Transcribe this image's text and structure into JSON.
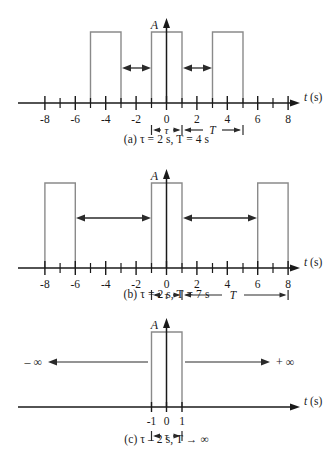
{
  "figure": {
    "axis_color": "#1a1a1a",
    "pulse_color": "#8a8a8a",
    "arrow_color": "#2a2a2a",
    "amplitude_label": "A",
    "time_axis_label": "t (s)",
    "tau_symbol": "τ",
    "period_symbol": "T"
  },
  "panels": [
    {
      "id": "a",
      "caption": "(a) τ = 2 s,  T = 4 s",
      "tau": 2,
      "period": 4,
      "amplitude_label": "A",
      "axis_label": "t (s)",
      "tau_label": "τ",
      "period_label": "T",
      "xmin": -9,
      "xmax": 9,
      "major_ticks": [
        -8,
        -6,
        -4,
        -2,
        0,
        2,
        4,
        6,
        8
      ],
      "tick_labels": [
        "-8",
        "-6",
        "-4",
        "-2",
        "0",
        "2",
        "4",
        "6",
        "8"
      ],
      "minor_ticks": [
        -7,
        -5,
        -3,
        -1,
        1,
        3,
        5,
        7
      ],
      "pulses": [
        {
          "start": -5,
          "end": -3
        },
        {
          "start": -1,
          "end": 1
        },
        {
          "start": 3,
          "end": 5
        }
      ],
      "gap_arrows": [
        {
          "from": -3,
          "to": -1
        },
        {
          "from": 1,
          "to": 3
        }
      ],
      "tau_span": {
        "from": -1,
        "to": 1
      },
      "period_span": {
        "from": 1,
        "to": 5
      }
    },
    {
      "id": "b",
      "caption": "(b) τ = 2 s,  T = 7 s",
      "tau": 2,
      "period": 7,
      "amplitude_label": "A",
      "axis_label": "t (s)",
      "tau_label": "τ",
      "period_label": "T",
      "xmin": -9,
      "xmax": 9,
      "major_ticks": [
        -8,
        -6,
        -4,
        -2,
        0,
        2,
        4,
        6,
        8
      ],
      "tick_labels": [
        "-8",
        "-6",
        "-4",
        "-2",
        "0",
        "2",
        "4",
        "6",
        "8"
      ],
      "minor_ticks": [
        -7,
        -5,
        -3,
        -1,
        1,
        3,
        5,
        7
      ],
      "pulses": [
        {
          "start": -8,
          "end": -6
        },
        {
          "start": -1,
          "end": 1
        },
        {
          "start": 6,
          "end": 8
        }
      ],
      "gap_arrows": [
        {
          "from": -6,
          "to": -1
        },
        {
          "from": 1,
          "to": 6
        }
      ],
      "tau_span": {
        "from": -1,
        "to": 1
      },
      "period_span": {
        "from": 1,
        "to": 8
      }
    },
    {
      "id": "c",
      "caption": "(c) τ – 2 s,  T → ∞",
      "tau": 2,
      "period": "infinite",
      "amplitude_label": "A",
      "axis_label": "t (s)",
      "tau_label": "τ",
      "xmin": -9,
      "xmax": 9,
      "major_ticks": [
        -1,
        0,
        1
      ],
      "tick_labels": [
        "-1",
        "0",
        "1"
      ],
      "minor_ticks": [],
      "pulses": [
        {
          "start": -1,
          "end": 1
        }
      ],
      "infinity_left_label": "– ∞",
      "infinity_right_label": "+ ∞",
      "tau_span": {
        "from": -1,
        "to": 1
      }
    }
  ]
}
